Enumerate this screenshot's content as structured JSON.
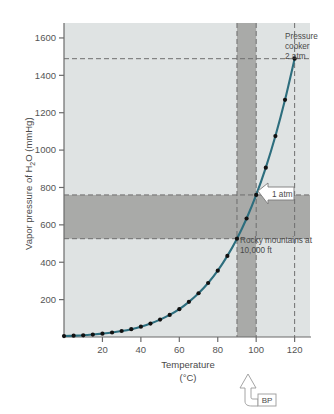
{
  "chart_data": {
    "type": "line",
    "title": "",
    "subtitle": "",
    "xlabel": "Temperature",
    "xlabel_units": "(°C)",
    "ylabel": "Vapor pressure of H₂O (mmHg)",
    "xlim": [
      0,
      128
    ],
    "ylim": [
      0,
      1680
    ],
    "xticks": [
      20,
      40,
      60,
      80,
      100,
      120
    ],
    "xtick_labels": [
      "20",
      "40",
      "60",
      "80",
      "100",
      "120"
    ],
    "yticks": [
      200,
      400,
      600,
      800,
      1000,
      1200,
      1400,
      1600
    ],
    "ytick_labels": [
      "200",
      "400",
      "600",
      "800",
      "1000",
      "1200",
      "1400",
      "1600"
    ],
    "grid": false,
    "legend": "none",
    "series": [
      {
        "name": "Vapor pressure of water",
        "color": "#2d6e7e",
        "marker": "circle",
        "marker_color": "#111111",
        "x": [
          0,
          5,
          10,
          15,
          20,
          25,
          30,
          35,
          40,
          45,
          50,
          55,
          60,
          65,
          70,
          75,
          80,
          85,
          90,
          95,
          100,
          105,
          110,
          115,
          120
        ],
        "y": [
          5,
          7,
          9,
          13,
          18,
          24,
          32,
          42,
          55,
          72,
          93,
          118,
          149,
          188,
          234,
          289,
          355,
          434,
          526,
          634,
          760,
          906,
          1075,
          1269,
          1489
        ]
      }
    ],
    "reference_lines": [
      {
        "name": "pressure-cooker-level",
        "orientation": "horizontal",
        "value": 1489,
        "style": "dashed",
        "label": "2 atm"
      },
      {
        "name": "one-atm-level",
        "orientation": "horizontal",
        "value": 760,
        "style": "dashed",
        "label": "1 atm"
      },
      {
        "name": "rocky-mountain-level",
        "orientation": "horizontal",
        "value": 526,
        "style": "dashed",
        "label": "0.69 atm"
      },
      {
        "name": "rocky-mountain-temperature",
        "orientation": "vertical",
        "value": 90,
        "style": "dashed",
        "label": "90"
      },
      {
        "name": "normal-boiling-point",
        "orientation": "vertical",
        "value": 100,
        "style": "dashed",
        "label": "100"
      },
      {
        "name": "pressure-cooker-temperature",
        "orientation": "vertical",
        "value": 120,
        "style": "dashed",
        "label": "120"
      }
    ],
    "shaded_bands": [
      {
        "name": "pressure-band",
        "orientation": "horizontal",
        "from": 526,
        "to": 760,
        "color": "#a9aaa8"
      },
      {
        "name": "temperature-band",
        "orientation": "vertical",
        "from": 90,
        "to": 100,
        "color": "#a9aaa8"
      }
    ],
    "plot_background": "#dfe3e3",
    "annotations": [
      {
        "name": "pressure-cooker",
        "text_line1": "Pressure",
        "text_line2": "cooker",
        "text_line3": "2 atm",
        "x": 120,
        "y": 1489
      },
      {
        "name": "one-atm",
        "text": "1 atm",
        "x": 100,
        "y": 760
      },
      {
        "name": "rocky-mountains",
        "text_line1": "Rocky mountains at",
        "text_line2": "10,000 ft",
        "x": 90,
        "y": 526
      },
      {
        "name": "boiling-point",
        "text": "BP",
        "x": 100,
        "y": 0
      }
    ]
  },
  "axis": {
    "y_label": "Vapor pressure of H₂O (mmHg)",
    "x_label": "Temperature",
    "x_units": "(°C)"
  },
  "labels": {
    "pressure_cooker_line1": "Pressure",
    "pressure_cooker_line2": "cooker",
    "pressure_cooker_line3": "2 atm",
    "one_atm": "1 atm",
    "rocky_line1": "Rocky mountains at",
    "rocky_line2": "10,000 ft",
    "bp": "BP"
  },
  "ticks": {
    "y": [
      "1600",
      "1400",
      "1200",
      "1000",
      "800",
      "600",
      "400",
      "200"
    ],
    "x": [
      "20",
      "40",
      "60",
      "80",
      "100",
      "120"
    ]
  },
  "colors": {
    "curve": "#2d6e7e",
    "marker": "#111111",
    "plot_background": "#dfe3e3",
    "band": "#a9aaa8",
    "axis": "#6b6b6b",
    "dash": "#6e6e6e"
  }
}
